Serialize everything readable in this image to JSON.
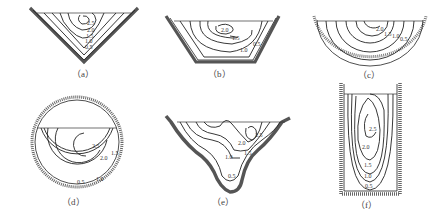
{
  "figure": {
    "panels": [
      {
        "id": "a",
        "caption": "（a）",
        "shape": "triangular channel",
        "contour_labels": [
          "2.5",
          "2.0",
          "1.5",
          "1.0",
          "0.5"
        ]
      },
      {
        "id": "b",
        "caption": "（b）",
        "shape": "trapezoidal channel",
        "contour_labels": [
          "2.0",
          "1.5",
          "1.0",
          "0.5"
        ]
      },
      {
        "id": "c",
        "caption": "（c）",
        "shape": "semicircular channel",
        "contour_labels": [
          "2.0",
          "1.5",
          "1.0",
          "0.5"
        ]
      },
      {
        "id": "d",
        "caption": "（d）",
        "shape": "partially filled circular pipe",
        "contour_labels": [
          "2.5",
          "2.0",
          "1.5",
          "1.0",
          "0.5"
        ]
      },
      {
        "id": "e",
        "caption": "（e）",
        "shape": "natural irregular channel",
        "contour_labels": [
          "2.5",
          "2.0",
          "1.5",
          "1.0",
          "0.5"
        ]
      },
      {
        "id": "f",
        "caption": "（f）",
        "shape": "narrow deep rectangular channel",
        "contour_labels": [
          "2.5",
          "2.0",
          "1.5",
          "1.0",
          "0.5"
        ]
      }
    ]
  }
}
